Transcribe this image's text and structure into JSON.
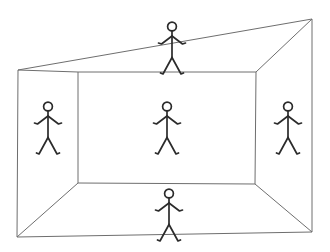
{
  "canvas": {
    "width": 330,
    "height": 252,
    "background": "#ffffff"
  },
  "diagram": {
    "style": {
      "box_stroke": "#6e6e6e",
      "box_stroke_width": 1,
      "figure_stroke": "#2b2b2b",
      "figure_stroke_width": 1.7
    },
    "geometry": {
      "front_frame": {
        "name": "front-opening",
        "points": [
          [
            18,
            70
          ],
          [
            312,
            19
          ],
          [
            312,
            232
          ],
          [
            17,
            237
          ]
        ]
      },
      "back_wall": {
        "name": "back-wall",
        "points": [
          [
            78,
            72
          ],
          [
            256,
            72
          ],
          [
            255,
            184
          ],
          [
            78,
            183
          ]
        ]
      },
      "corner_edges": [
        {
          "name": "edge-top-left",
          "from": [
            18,
            70
          ],
          "to": [
            78,
            72
          ]
        },
        {
          "name": "edge-top-right",
          "from": [
            312,
            19
          ],
          "to": [
            256,
            72
          ]
        },
        {
          "name": "edge-bottom-right",
          "from": [
            312,
            232
          ],
          "to": [
            255,
            184
          ]
        },
        {
          "name": "edge-bottom-left",
          "from": [
            17,
            237
          ],
          "to": [
            78,
            183
          ]
        }
      ]
    }
  },
  "figures": [
    {
      "id": "ceiling",
      "label": "Figure on ceiling",
      "surface": "ceiling",
      "cx": 172,
      "cy": 21,
      "scale": 1.0
    },
    {
      "id": "left-wall",
      "label": "Figure on left wall",
      "surface": "left wall",
      "cx": 48,
      "cy": 101,
      "scale": 1.0
    },
    {
      "id": "back-wall",
      "label": "Figure on back wall",
      "surface": "back wall",
      "cx": 167,
      "cy": 101,
      "scale": 1.0
    },
    {
      "id": "right-wall",
      "label": "Figure on right wall",
      "surface": "right wall",
      "cx": 288,
      "cy": 101,
      "scale": 1.0
    },
    {
      "id": "floor",
      "label": "Figure on floor",
      "surface": "floor",
      "cx": 169,
      "cy": 188,
      "scale": 1.0
    }
  ],
  "figure_template": {
    "head": {
      "cx": 0,
      "cy": 5.5,
      "r": 4.4
    },
    "torso": {
      "x1": 0,
      "y1": 10.2,
      "x2": 0,
      "y2": 36.5
    },
    "arm_left": {
      "points": [
        [
          0,
          15.0
        ],
        [
          -10.5,
          23.0
        ],
        [
          -13.5,
          22.0
        ]
      ]
    },
    "arm_right": {
      "points": [
        [
          0,
          15.0
        ],
        [
          10.5,
          23.0
        ],
        [
          13.5,
          22.0
        ]
      ]
    },
    "leg_left": {
      "points": [
        [
          0,
          36.5
        ],
        [
          -9.0,
          53.0
        ],
        [
          -11.5,
          52.0
        ]
      ]
    },
    "leg_right": {
      "points": [
        [
          0,
          36.5
        ],
        [
          9.0,
          53.0
        ],
        [
          11.5,
          52.0
        ]
      ]
    }
  }
}
